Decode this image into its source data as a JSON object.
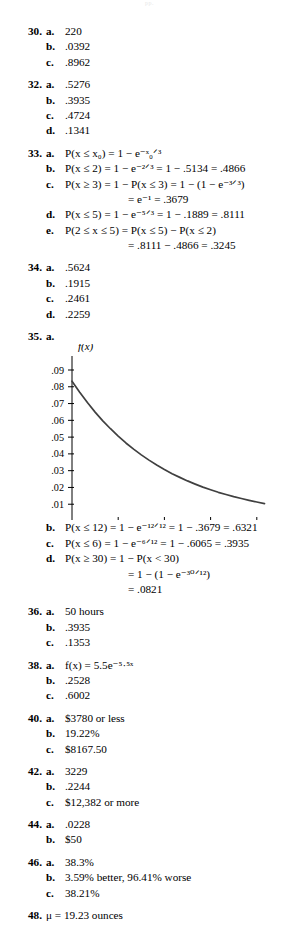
{
  "page": {
    "running_head": "pp.",
    "document_type": "answer-key"
  },
  "problems": [
    {
      "number": "30.",
      "parts": [
        {
          "letter": "a.",
          "value": "220"
        },
        {
          "letter": "b.",
          "value": ".0392"
        },
        {
          "letter": "c.",
          "value": ".8962"
        }
      ]
    },
    {
      "number": "32.",
      "parts": [
        {
          "letter": "a.",
          "value": ".5276"
        },
        {
          "letter": "b.",
          "value": ".3935"
        },
        {
          "letter": "c.",
          "value": ".4724"
        },
        {
          "letter": "d.",
          "value": ".1341"
        }
      ]
    },
    {
      "number": "33.",
      "parts": [
        {
          "letter": "a.",
          "value": "P(x ≤ x₀) = 1 − e⁻ˣ₀ᐟ³"
        },
        {
          "letter": "b.",
          "value": "P(x ≤ 2) = 1 − e⁻²ᐟ³ = 1 − .5134 = .4866"
        },
        {
          "letter": "c.",
          "value": "P(x ≥ 3) = 1 − P(x ≤ 3) = 1 − (1 − e⁻³ᐟ³)",
          "continuation": "= e⁻¹ = .3679"
        },
        {
          "letter": "d.",
          "value": "P(x ≤ 5) = 1 − e⁻⁵ᐟ³ = 1 − .1889 = .8111"
        },
        {
          "letter": "e.",
          "value": "P(2 ≤ x ≤ 5) = P(x ≤ 5) − P(x ≤ 2)",
          "continuation": "= .8111 − .4866 = .3245"
        }
      ]
    },
    {
      "number": "34.",
      "parts": [
        {
          "letter": "a.",
          "value": ".5624"
        },
        {
          "letter": "b.",
          "value": ".1915"
        },
        {
          "letter": "c.",
          "value": ".2461"
        },
        {
          "letter": "d.",
          "value": ".2259"
        }
      ]
    },
    {
      "number": "35.",
      "parts": [
        {
          "letter": "a.",
          "value": ""
        },
        {
          "letter": "b.",
          "value": "P(x ≤ 12) = 1 − e⁻¹²ᐟ¹² = 1 − .3679 = .6321"
        },
        {
          "letter": "c.",
          "value": "P(x ≤ 6)   = 1 − e⁻⁶ᐟ¹² = 1 − .6065 = .3935"
        },
        {
          "letter": "d.",
          "value": "P(x ≥ 30) = 1 − P(x < 30)",
          "continuation": "= 1 − (1 − e⁻³⁰ᐟ¹²)",
          "continuation2": "= .0821"
        }
      ]
    },
    {
      "number": "36.",
      "parts": [
        {
          "letter": "a.",
          "value": "50 hours"
        },
        {
          "letter": "b.",
          "value": ".3935"
        },
        {
          "letter": "c.",
          "value": ".1353"
        }
      ]
    },
    {
      "number": "38.",
      "parts": [
        {
          "letter": "a.",
          "value": "f(x) = 5.5e⁻⁵·⁵ˣ"
        },
        {
          "letter": "b.",
          "value": ".2528"
        },
        {
          "letter": "c.",
          "value": ".6002"
        }
      ]
    },
    {
      "number": "40.",
      "parts": [
        {
          "letter": "a.",
          "value": "$3780 or less"
        },
        {
          "letter": "b.",
          "value": "19.22%"
        },
        {
          "letter": "c.",
          "value": "$8167.50"
        }
      ]
    },
    {
      "number": "42.",
      "parts": [
        {
          "letter": "a.",
          "value": "3229"
        },
        {
          "letter": "b.",
          "value": ".2244"
        },
        {
          "letter": "c.",
          "value": "$12,382 or more"
        }
      ]
    },
    {
      "number": "44.",
      "parts": [
        {
          "letter": "a.",
          "value": ".0228"
        },
        {
          "letter": "b.",
          "value": "$50"
        }
      ]
    },
    {
      "number": "46.",
      "parts": [
        {
          "letter": "a.",
          "value": "38.3%"
        },
        {
          "letter": "b.",
          "value": "3.59% better, 96.41% worse"
        },
        {
          "letter": "c.",
          "value": "38.21%"
        }
      ]
    },
    {
      "number": "48.",
      "parts": [
        {
          "letter": "",
          "value": "μ = 19.23 ounces"
        }
      ]
    }
  ],
  "chart_data": {
    "type": "line",
    "title": "",
    "xlabel": "x",
    "ylabel": "f(x)",
    "xlim": [
      0,
      26
    ],
    "ylim": [
      0,
      0.095
    ],
    "xticks": [
      0,
      6,
      12,
      18,
      24
    ],
    "xtick_labels": [
      "0",
      "6",
      "12",
      "18",
      "24"
    ],
    "yticks": [
      0.01,
      0.02,
      0.03,
      0.04,
      0.05,
      0.06,
      0.07,
      0.08,
      0.09
    ],
    "ytick_labels": [
      ".01",
      ".02",
      ".03",
      ".04",
      ".05",
      ".06",
      ".07",
      ".08",
      ".09"
    ],
    "grid": false,
    "legend": false,
    "function": "f(x) = (1/12)e^(-x/12)",
    "series": [
      {
        "name": "f(x)",
        "color": "#404040",
        "x": [
          0,
          1,
          2,
          3,
          4,
          5,
          6,
          7,
          8,
          9,
          10,
          11,
          12,
          13,
          14,
          15,
          16,
          17,
          18,
          19,
          20,
          21,
          22,
          23,
          24,
          25
        ],
        "values": [
          0.0833,
          0.0767,
          0.0706,
          0.0649,
          0.0597,
          0.055,
          0.0506,
          0.0465,
          0.0428,
          0.0394,
          0.0363,
          0.0334,
          0.0307,
          0.0282,
          0.026,
          0.0239,
          0.022,
          0.0202,
          0.0186,
          0.0171,
          0.0158,
          0.0145,
          0.0134,
          0.0123,
          0.0113,
          0.0104
        ]
      }
    ]
  },
  "chart_geometry": {
    "origin_x": 72,
    "origin_y": 487,
    "x_unit_px": 7.7,
    "y_top_value": 0.09,
    "y_top_px": 336,
    "y_px_per_unit": 1670
  }
}
